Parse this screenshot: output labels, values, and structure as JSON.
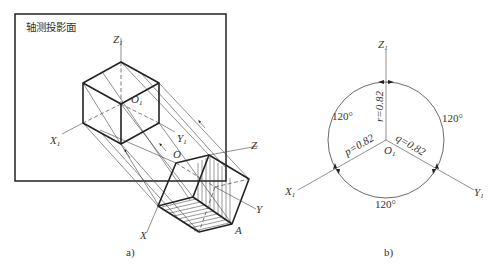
{
  "figure_a": {
    "plane_label": "轴测投影面",
    "caption": "a)",
    "labels": {
      "z1": "Z",
      "z1_sub": "1",
      "x1": "X",
      "x1_sub": "1",
      "y1": "Y",
      "y1_sub": "1",
      "o1": "O",
      "o1_sub": "1",
      "o": "O",
      "x": "X",
      "y": "Y",
      "z": "Z",
      "a": "A"
    }
  },
  "figure_b": {
    "caption": "b)",
    "labels": {
      "z1": "Z",
      "z1_sub": "1",
      "x1": "X",
      "x1_sub": "1",
      "y1": "Y",
      "y1_sub": "1",
      "o1": "O",
      "o1_sub": "1"
    },
    "angles": {
      "left": "120°",
      "right": "120°",
      "bottom": "120°"
    },
    "coefficients": {
      "p": "p=0.82",
      "q": "q=0.82",
      "r": "r=0.82"
    }
  }
}
